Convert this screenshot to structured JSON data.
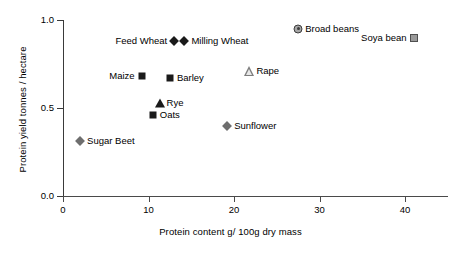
{
  "chart_data": {
    "type": "scatter",
    "title": "",
    "xlabel": "Protein content g/ 100g dry mass",
    "ylabel": "Protein yield tonnes / hectare",
    "xlim": [
      0,
      45
    ],
    "ylim": [
      0.0,
      1.0
    ],
    "xticks": [
      "0",
      "10",
      "20",
      "30",
      "40"
    ],
    "xtick_values": [
      0,
      10,
      20,
      30,
      40
    ],
    "yticks": [
      "0.0",
      "0.5",
      "1.0"
    ],
    "ytick_values": [
      0.0,
      0.5,
      1.0
    ],
    "grid": false,
    "legend": "none (points labelled inline)",
    "points": [
      {
        "name": "Sugar Beet",
        "x": 2.0,
        "y": 0.31,
        "marker": "diamond-gray",
        "label": "Sugar Beet",
        "label_side": "right"
      },
      {
        "name": "Maize",
        "x": 9.2,
        "y": 0.68,
        "marker": "square-filled",
        "label": "Maize",
        "label_side": "left"
      },
      {
        "name": "Oats",
        "x": 10.5,
        "y": 0.46,
        "marker": "square-filled",
        "label": "Oats",
        "label_side": "right"
      },
      {
        "name": "Rye",
        "x": 11.3,
        "y": 0.53,
        "marker": "triangle-filled",
        "label": "Rye",
        "label_side": "right"
      },
      {
        "name": "Barley",
        "x": 12.5,
        "y": 0.67,
        "marker": "square-filled",
        "label": "Barley",
        "label_side": "right"
      },
      {
        "name": "Feed Wheat",
        "x": 13.0,
        "y": 0.88,
        "marker": "diamond-filled",
        "label": "Feed Wheat",
        "label_side": "left"
      },
      {
        "name": "Milling Wheat",
        "x": 14.2,
        "y": 0.88,
        "marker": "diamond-filled",
        "label": "Milling Wheat",
        "label_side": "right"
      },
      {
        "name": "Sunflower",
        "x": 19.2,
        "y": 0.4,
        "marker": "diamond-gray",
        "label": "Sunflower",
        "label_side": "right"
      },
      {
        "name": "Rape",
        "x": 21.8,
        "y": 0.71,
        "marker": "triangle-open",
        "label": "Rape",
        "label_side": "right"
      },
      {
        "name": "Broad beans",
        "x": 27.5,
        "y": 0.95,
        "marker": "circle-target",
        "label": "Broad beans",
        "label_side": "right"
      },
      {
        "name": "Soya bean",
        "x": 41.0,
        "y": 0.9,
        "marker": "square-gray",
        "label": "Soya bean",
        "label_side": "left"
      }
    ]
  },
  "axes": {
    "x": {
      "title": "Protein content g/ 100g dry mass",
      "tick_labels": [
        "0",
        "10",
        "20",
        "30",
        "40"
      ]
    },
    "y": {
      "title": "Protein yield tonnes / hectare",
      "tick_labels": [
        "0.0",
        "0.5",
        "1.0"
      ]
    }
  },
  "colors": {
    "background": "#ffffff",
    "axis": "#3a3a3a",
    "marker_dark": "#1a1a1a",
    "marker_gray": "#9a9a9a",
    "text": "#000000"
  }
}
